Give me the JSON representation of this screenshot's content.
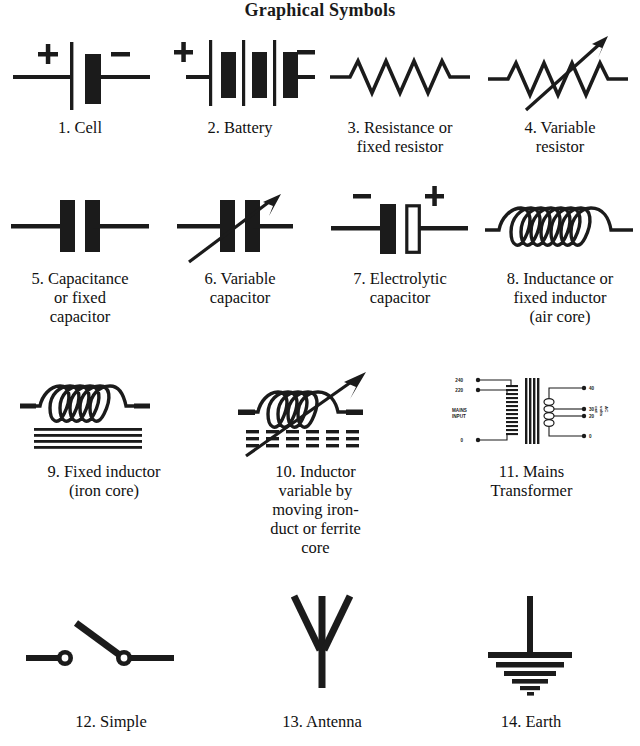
{
  "title": "Graphical Symbols",
  "symbols": [
    {
      "index": "1.",
      "name": "cell-symbol",
      "caption": "1. Cell",
      "polarity": {
        "positive": "+",
        "negative": "−"
      }
    },
    {
      "index": "2.",
      "name": "battery-symbol",
      "caption": "2. Battery",
      "polarity": {
        "positive": "+",
        "negative": "−"
      }
    },
    {
      "index": "3.",
      "name": "resistor-symbol",
      "caption": "3. Resistance or\nfixed resistor"
    },
    {
      "index": "4.",
      "name": "variable-resistor-symbol",
      "caption": "4. Variable\nresistor"
    },
    {
      "index": "5.",
      "name": "capacitor-symbol",
      "caption": "5. Capacitance\nor fixed\ncapacitor"
    },
    {
      "index": "6.",
      "name": "variable-capacitor-symbol",
      "caption": "6. Variable\ncapacitor"
    },
    {
      "index": "7.",
      "name": "electrolytic-capacitor-symbol",
      "caption": "7. Electrolytic\ncapacitor",
      "polarity": {
        "positive": "+",
        "negative": "−"
      }
    },
    {
      "index": "8.",
      "name": "air-core-inductor-symbol",
      "caption": "8. Inductance or\nfixed inductor\n(air core)"
    },
    {
      "index": "9.",
      "name": "iron-core-inductor-symbol",
      "caption": "9. Fixed inductor\n(iron core)"
    },
    {
      "index": "10.",
      "name": "variable-inductor-symbol",
      "caption": "10. Inductor\nvariable by\nmoving iron-\nduct or ferrite\ncore"
    },
    {
      "index": "11.",
      "name": "mains-transformer-symbol",
      "caption": "11. Mains\nTransformer"
    },
    {
      "index": "12.",
      "name": "switch-symbol",
      "caption": "12. Simple"
    },
    {
      "index": "13.",
      "name": "antenna-symbol",
      "caption": "13. Antenna"
    },
    {
      "index": "14.",
      "name": "earth-symbol",
      "caption": "14. Earth"
    }
  ],
  "transformer": {
    "primary_taps": [
      "240",
      "220",
      "0"
    ],
    "primary_label_line1": "MAINS",
    "primary_label_line2": "INPUT",
    "secondary_taps": [
      "40",
      "30",
      "20",
      "0"
    ],
    "secondary_label_line1": "AC",
    "secondary_label_line2": "volts",
    "secondary_label_line3": "out"
  },
  "colors": {
    "ink": "#1b1b1b",
    "paper": "#ffffff"
  }
}
